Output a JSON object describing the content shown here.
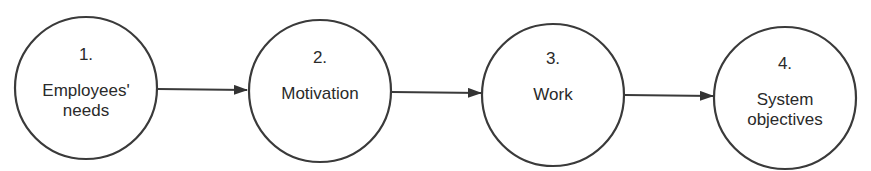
{
  "diagram": {
    "type": "flow",
    "nodes": [
      {
        "number": "1.",
        "label_line1": "Employees'",
        "label_line2": "needs"
      },
      {
        "number": "2.",
        "label_line1": "Motivation",
        "label_line2": ""
      },
      {
        "number": "3.",
        "label_line1": "Work",
        "label_line2": ""
      },
      {
        "number": "4.",
        "label_line1": "System",
        "label_line2": "objectives"
      }
    ],
    "edges": [
      {
        "from": "1",
        "to": "2"
      },
      {
        "from": "2",
        "to": "3"
      },
      {
        "from": "3",
        "to": "4"
      }
    ],
    "colors": {
      "stroke": "#3a3a3a",
      "background": "#ffffff",
      "text": "#2a2a2a"
    }
  }
}
